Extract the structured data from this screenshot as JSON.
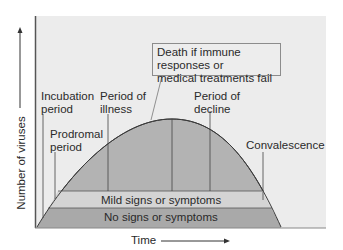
{
  "diagram": {
    "y_axis_label": "Number of viruses",
    "x_axis_label": "Time",
    "phases": [
      {
        "label_line1": "Incubation",
        "label_line2": "period"
      },
      {
        "label_line1": "Prodromal",
        "label_line2": "period"
      },
      {
        "label_line1": "Period of",
        "label_line2": "illness"
      },
      {
        "label_line1": "Period of",
        "label_line2": "decline"
      },
      {
        "label_line1": "Convalescence",
        "label_line2": ""
      }
    ],
    "callout": {
      "line1": "Death if immune responses or",
      "line2": "medical treatments fail"
    },
    "bands": {
      "mild": "Mild signs or symptoms",
      "none": "No signs or symptoms"
    },
    "colors": {
      "background_panel": "#ececec",
      "curve_fill": "#b3b3b3",
      "band_light": "#d4d4d4",
      "band_dark": "#a9a9a9",
      "line": "#3a3a3a"
    }
  }
}
